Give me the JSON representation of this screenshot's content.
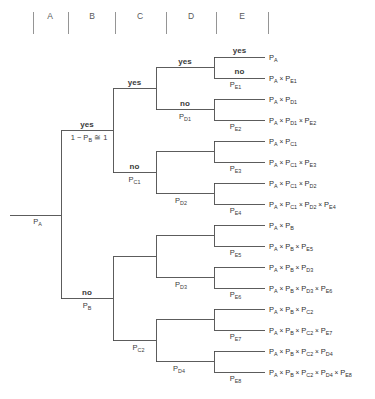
{
  "diagram": {
    "type": "decision-tree",
    "columns": [
      {
        "id": "A",
        "label": "A",
        "x": 50
      },
      {
        "id": "B",
        "label": "B",
        "x": 92
      },
      {
        "id": "C",
        "label": "C",
        "x": 140
      },
      {
        "id": "D",
        "label": "D",
        "x": 191
      },
      {
        "id": "E",
        "label": "E",
        "x": 242
      }
    ],
    "dividers": [
      33,
      68,
      115,
      166,
      216,
      268
    ],
    "divider_top": 12,
    "divider_bottom": 34,
    "column_label_y": 19,
    "root": {
      "name": "root",
      "prob": "P_A",
      "prob_text": "P",
      "prob_sub": "A"
    },
    "branches": {
      "b_yes": {
        "label": "yes",
        "prob_text": "1 − P",
        "prob_sub": "B",
        "prob_tail": " ≅ 1"
      },
      "b_no": {
        "label": "no",
        "prob_text": "P",
        "prob_sub": "B"
      },
      "c1_yes": {
        "label": "yes",
        "prob_text": "",
        "prob_sub": ""
      },
      "c1_no": {
        "label": "no",
        "prob_text": "P",
        "prob_sub": "C1"
      },
      "c2_no": {
        "label": "",
        "prob_text": "P",
        "prob_sub": "C2"
      },
      "d1_yes": {
        "label": "yes",
        "prob_text": "",
        "prob_sub": ""
      },
      "d1_no": {
        "label": "no",
        "prob_text": "P",
        "prob_sub": "D1"
      },
      "d2_no": {
        "label": "",
        "prob_text": "P",
        "prob_sub": "D2"
      },
      "d3_no": {
        "label": "",
        "prob_text": "P",
        "prob_sub": "D3"
      },
      "d4_no": {
        "label": "",
        "prob_text": "P",
        "prob_sub": "D4"
      },
      "e1_yes": {
        "label": "yes",
        "prob_text": "",
        "prob_sub": ""
      },
      "e1_no": {
        "label": "no",
        "prob_text": "P",
        "prob_sub": "E1"
      },
      "e2": {
        "label": "",
        "prob_text": "P",
        "prob_sub": "E2"
      },
      "e3": {
        "label": "",
        "prob_text": "P",
        "prob_sub": "E3"
      },
      "e4": {
        "label": "",
        "prob_text": "P",
        "prob_sub": "E4"
      },
      "e5": {
        "label": "",
        "prob_text": "P",
        "prob_sub": "E5"
      },
      "e6": {
        "label": "",
        "prob_text": "P",
        "prob_sub": "E6"
      },
      "e7": {
        "label": "",
        "prob_text": "P",
        "prob_sub": "E7"
      },
      "e8": {
        "label": "",
        "prob_text": "P",
        "prob_sub": "E8"
      }
    },
    "leaves": [
      {
        "index": 1,
        "y": 57,
        "terms": [
          {
            "base": "P",
            "sub": "A"
          }
        ]
      },
      {
        "index": 2,
        "y": 78,
        "terms": [
          {
            "base": "P",
            "sub": "A"
          },
          {
            "base": "P",
            "sub": "E1"
          }
        ]
      },
      {
        "index": 3,
        "y": 99,
        "terms": [
          {
            "base": "P",
            "sub": "A"
          },
          {
            "base": "P",
            "sub": "D1"
          }
        ]
      },
      {
        "index": 4,
        "y": 120,
        "terms": [
          {
            "base": "P",
            "sub": "A"
          },
          {
            "base": "P",
            "sub": "D1"
          },
          {
            "base": "P",
            "sub": "E2"
          }
        ]
      },
      {
        "index": 5,
        "y": 141,
        "terms": [
          {
            "base": "P",
            "sub": "A"
          },
          {
            "base": "P",
            "sub": "C1"
          }
        ]
      },
      {
        "index": 6,
        "y": 162,
        "terms": [
          {
            "base": "P",
            "sub": "A"
          },
          {
            "base": "P",
            "sub": "C1"
          },
          {
            "base": "P",
            "sub": "E3"
          }
        ]
      },
      {
        "index": 7,
        "y": 183,
        "terms": [
          {
            "base": "P",
            "sub": "A"
          },
          {
            "base": "P",
            "sub": "C1"
          },
          {
            "base": "P",
            "sub": "D2"
          }
        ]
      },
      {
        "index": 8,
        "y": 204,
        "terms": [
          {
            "base": "P",
            "sub": "A"
          },
          {
            "base": "P",
            "sub": "C1"
          },
          {
            "base": "P",
            "sub": "D2"
          },
          {
            "base": "P",
            "sub": "E4"
          }
        ]
      },
      {
        "index": 9,
        "y": 225,
        "terms": [
          {
            "base": "P",
            "sub": "A"
          },
          {
            "base": "P",
            "sub": "B"
          }
        ]
      },
      {
        "index": 10,
        "y": 246,
        "terms": [
          {
            "base": "P",
            "sub": "A"
          },
          {
            "base": "P",
            "sub": "B"
          },
          {
            "base": "P",
            "sub": "E5"
          }
        ]
      },
      {
        "index": 11,
        "y": 267,
        "terms": [
          {
            "base": "P",
            "sub": "A"
          },
          {
            "base": "P",
            "sub": "B"
          },
          {
            "base": "P",
            "sub": "D3"
          }
        ]
      },
      {
        "index": 12,
        "y": 288,
        "terms": [
          {
            "base": "P",
            "sub": "A"
          },
          {
            "base": "P",
            "sub": "B"
          },
          {
            "base": "P",
            "sub": "D3"
          },
          {
            "base": "P",
            "sub": "E6"
          }
        ]
      },
      {
        "index": 13,
        "y": 309,
        "terms": [
          {
            "base": "P",
            "sub": "A"
          },
          {
            "base": "P",
            "sub": "B"
          },
          {
            "base": "P",
            "sub": "C2"
          }
        ]
      },
      {
        "index": 14,
        "y": 330,
        "terms": [
          {
            "base": "P",
            "sub": "A"
          },
          {
            "base": "P",
            "sub": "B"
          },
          {
            "base": "P",
            "sub": "C2"
          },
          {
            "base": "P",
            "sub": "E7"
          }
        ]
      },
      {
        "index": 15,
        "y": 351,
        "terms": [
          {
            "base": "P",
            "sub": "A"
          },
          {
            "base": "P",
            "sub": "B"
          },
          {
            "base": "P",
            "sub": "C2"
          },
          {
            "base": "P",
            "sub": "D4"
          }
        ]
      },
      {
        "index": 16,
        "y": 372,
        "terms": [
          {
            "base": "P",
            "sub": "A"
          },
          {
            "base": "P",
            "sub": "B"
          },
          {
            "base": "P",
            "sub": "C2"
          },
          {
            "base": "P",
            "sub": "D4"
          },
          {
            "base": "P",
            "sub": "E8"
          }
        ]
      }
    ],
    "multiply_symbol": "×",
    "colors": {
      "line": "#4a4a4a",
      "divider": "#8a8a8a",
      "text": "#2e2e2e",
      "background": "#ffffff"
    },
    "geometry": {
      "root_x_start": 10,
      "root_x_node": 61,
      "c_node_x": 113,
      "d_node_x": 156,
      "e_node_x": 214,
      "leaf_line_end": 265,
      "leaf_text_x": 269,
      "root_y": 215
    }
  }
}
